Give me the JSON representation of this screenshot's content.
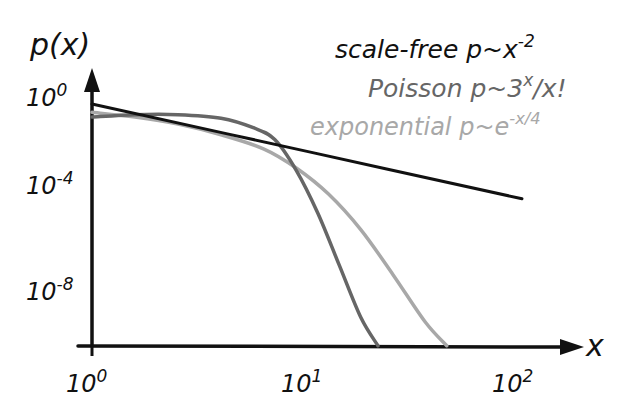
{
  "chart_data": {
    "type": "line",
    "title": "",
    "xlabel": "x",
    "ylabel": "p(x)",
    "xscale": "log",
    "yscale": "log",
    "xlim": [
      1,
      100
    ],
    "ylim_log10": [
      -10.2,
      0.3
    ],
    "grid": false,
    "legend_position": "top-right",
    "x_ticks": [
      {
        "value": 1,
        "base": "10",
        "exp": "0"
      },
      {
        "value": 10,
        "base": "10",
        "exp": "1"
      },
      {
        "value": 100,
        "base": "10",
        "exp": "2"
      }
    ],
    "y_ticks": [
      {
        "log10": 0,
        "base": "10",
        "exp": "0"
      },
      {
        "log10": -4,
        "base": "10",
        "exp": "-4"
      },
      {
        "log10": -8,
        "base": "10",
        "exp": "-8"
      }
    ],
    "series": [
      {
        "name": "scale-free",
        "formula_base": "p~x",
        "formula_exp": "-2",
        "color": "#111111",
        "note": "power law, straight line on log-log",
        "points_log10": [
          [
            0,
            0
          ],
          [
            1,
            -2
          ],
          [
            2,
            -4
          ]
        ]
      },
      {
        "name": "Poisson",
        "formula_base": "p~3",
        "formula_exp": "x",
        "formula_tail": "/x!",
        "color": "#666666",
        "points_log10": [
          [
            0,
            -0.55
          ],
          [
            0.2,
            -0.45
          ],
          [
            0.4,
            -0.45
          ],
          [
            0.6,
            -0.6
          ],
          [
            0.75,
            -1.0
          ],
          [
            0.85,
            -1.5
          ],
          [
            0.95,
            -2.8
          ],
          [
            1.05,
            -4.6
          ],
          [
            1.15,
            -6.8
          ],
          [
            1.25,
            -9.0
          ],
          [
            1.33,
            -10.2
          ]
        ]
      },
      {
        "name": "exponential",
        "formula_base": "p~e",
        "formula_exp": "-x/4",
        "color": "#a8a8a8",
        "points_log10": [
          [
            0,
            -0.35
          ],
          [
            0.2,
            -0.55
          ],
          [
            0.4,
            -0.85
          ],
          [
            0.6,
            -1.3
          ],
          [
            0.8,
            -1.9
          ],
          [
            0.95,
            -2.7
          ],
          [
            1.1,
            -3.8
          ],
          [
            1.25,
            -5.3
          ],
          [
            1.4,
            -7.2
          ],
          [
            1.55,
            -9.2
          ],
          [
            1.65,
            -10.2
          ]
        ]
      }
    ]
  }
}
